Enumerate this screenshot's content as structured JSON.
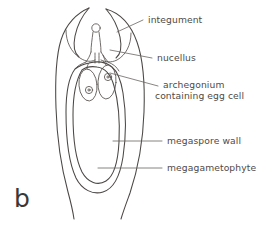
{
  "figure": {
    "panel_letter": "b",
    "background_color": "#ffffff",
    "ink_color": "#4a4745",
    "text_color": "#4d4a49"
  },
  "labels": [
    {
      "id": "integument",
      "text": "integument",
      "lines": [
        "integument"
      ],
      "text_x": 176,
      "text_y": 23,
      "leader": "M 143 20 L 117 32"
    },
    {
      "id": "nucellus",
      "text": "nucellus",
      "lines": [
        "nucellus"
      ],
      "text_x": 166,
      "text_y": 61,
      "leader": "M 152 58 L 110 50"
    },
    {
      "id": "archegonium",
      "text": "archegonium containing egg cell",
      "lines": [
        "archegonium",
        "containing egg cell"
      ],
      "text_x": 170,
      "text_y": 88,
      "leader": "M 158 86 L 110 73"
    },
    {
      "id": "megaspore-wall",
      "text": "megaspore wall",
      "lines": [
        "megaspore wall"
      ],
      "text_x": 166,
      "text_y": 144,
      "leader": "M 162 141 L 113 141"
    },
    {
      "id": "megagametophyte",
      "text": "megagametophyte",
      "lines": [
        "megagametophyte"
      ],
      "text_x": 166,
      "text_y": 171,
      "leader": "M 162 168 L 98 168"
    }
  ],
  "structures": [
    {
      "id": "integument-outer-left",
      "name": "integument outer wall (left)"
    },
    {
      "id": "integument-outer-right",
      "name": "integument outer wall (right)"
    },
    {
      "id": "micropyle",
      "name": "micropyle opening"
    },
    {
      "id": "nucellus-body",
      "name": "nucellus"
    },
    {
      "id": "pollen-chamber",
      "name": "pollen chamber / neck"
    },
    {
      "id": "megaspore-wall-outline",
      "name": "megaspore wall"
    },
    {
      "id": "megagametophyte-outline",
      "name": "megagametophyte"
    },
    {
      "id": "archegonium-left",
      "name": "archegonium (left)"
    },
    {
      "id": "archegonium-right",
      "name": "archegonium (right)"
    },
    {
      "id": "egg-cell-left",
      "name": "egg cell (left)"
    },
    {
      "id": "egg-cell-right",
      "name": "egg cell (right)"
    }
  ]
}
